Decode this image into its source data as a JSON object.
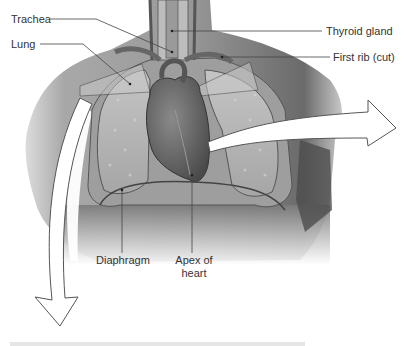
{
  "figure": {
    "type": "anatomical-illustration",
    "labels": [
      {
        "id": "trachea",
        "text": "Trachea"
      },
      {
        "id": "lung",
        "text": "Lung"
      },
      {
        "id": "thyroid",
        "text": "Thyroid gland"
      },
      {
        "id": "first_rib",
        "text": "First rib (cut)"
      },
      {
        "id": "diaphragm",
        "text": "Diaphragm"
      },
      {
        "id": "apex_line1",
        "text": "Apex of"
      },
      {
        "id": "apex_line2",
        "text": "heart"
      }
    ],
    "colors": {
      "background": "#ffffff",
      "torso": "#8c8c8c",
      "torso_shadow": "#5a5a5a",
      "lung": "#b5b5b5",
      "heart": "#6e6e6e",
      "leader_line": "#444444",
      "arrow_fill": "#ffffff",
      "arrow_stroke": "#555555"
    }
  }
}
